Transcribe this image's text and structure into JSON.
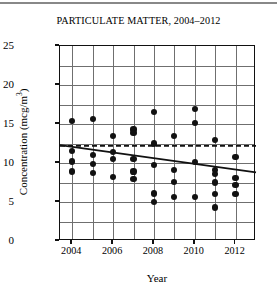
{
  "chart_data": {
    "type": "scatter",
    "title": "PARTICULATE MATTER, 2004–2012",
    "xlabel": "Year",
    "ylabel": "Concentration (mcg/m³)",
    "ylabel_text": "Concentration (mcg/m",
    "ylabel_sup": "3",
    "ylabel_tail": ")",
    "xlim": [
      2003.4,
      2013.0
    ],
    "ylim": [
      0,
      25
    ],
    "grid": true,
    "legend": "none",
    "y_ticks": [
      0,
      5,
      10,
      15,
      20,
      25
    ],
    "y_tick_labels": [
      "0",
      "5",
      "10",
      "15",
      "20",
      "25"
    ],
    "y_gridlines": [
      0,
      2.5,
      5,
      7.5,
      10,
      12.5,
      15,
      17.5,
      20,
      22.5,
      25
    ],
    "x_ticks": [
      2004,
      2006,
      2008,
      2010,
      2012
    ],
    "x_tick_labels": [
      "2004",
      "2006",
      "2008",
      "2010",
      "2012"
    ],
    "x_gridlines": [
      2004,
      2005,
      2006,
      2007,
      2008,
      2009,
      2010,
      2011,
      2012
    ],
    "points": [
      {
        "x": 2004,
        "y": 15.4
      },
      {
        "x": 2004,
        "y": 11.5
      },
      {
        "x": 2004,
        "y": 10.2
      },
      {
        "x": 2004,
        "y": 8.9
      },
      {
        "x": 2005,
        "y": 15.6
      },
      {
        "x": 2005,
        "y": 11.0
      },
      {
        "x": 2005,
        "y": 9.9
      },
      {
        "x": 2005,
        "y": 8.7
      },
      {
        "x": 2006,
        "y": 13.5
      },
      {
        "x": 2006,
        "y": 11.4
      },
      {
        "x": 2006,
        "y": 10.5
      },
      {
        "x": 2006,
        "y": 8.2
      },
      {
        "x": 2007,
        "y": 14.3
      },
      {
        "x": 2007,
        "y": 13.8
      },
      {
        "x": 2007,
        "y": 10.5
      },
      {
        "x": 2007,
        "y": 8.9
      },
      {
        "x": 2007,
        "y": 7.9
      },
      {
        "x": 2008,
        "y": 16.5
      },
      {
        "x": 2008,
        "y": 12.5
      },
      {
        "x": 2008,
        "y": 9.7
      },
      {
        "x": 2008,
        "y": 6.1
      },
      {
        "x": 2008,
        "y": 5.0
      },
      {
        "x": 2009,
        "y": 13.5
      },
      {
        "x": 2009,
        "y": 9.1
      },
      {
        "x": 2009,
        "y": 7.6
      },
      {
        "x": 2009,
        "y": 5.6
      },
      {
        "x": 2010,
        "y": 16.9
      },
      {
        "x": 2010,
        "y": 15.1
      },
      {
        "x": 2010,
        "y": 10.1
      },
      {
        "x": 2010,
        "y": 5.6
      },
      {
        "x": 2011,
        "y": 12.9
      },
      {
        "x": 2011,
        "y": 9.1
      },
      {
        "x": 2011,
        "y": 8.6
      },
      {
        "x": 2011,
        "y": 7.5
      },
      {
        "x": 2011,
        "y": 6.0
      },
      {
        "x": 2011,
        "y": 4.3
      },
      {
        "x": 2012,
        "y": 10.8
      },
      {
        "x": 2012,
        "y": 8.1
      },
      {
        "x": 2012,
        "y": 7.2
      },
      {
        "x": 2012,
        "y": 6.0
      }
    ],
    "trend_line": {
      "style": "solid",
      "color": "#111111",
      "x_start": 2003.4,
      "y_start": 12.3,
      "x_end": 2013.0,
      "y_end": 8.8
    },
    "reference_line": {
      "style": "dashed",
      "color": "#111111",
      "y": 12.2,
      "label": ""
    },
    "colors": {
      "marker": "#111111",
      "grid": "#6f6f6f",
      "axis": "#111111",
      "background": "#ffffff"
    }
  }
}
